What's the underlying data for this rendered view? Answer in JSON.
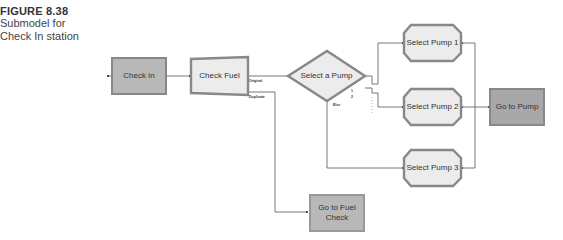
{
  "caption": {
    "figure_number": "FIGURE 8.38",
    "line1": "Submodel for",
    "line2": "Check In station"
  },
  "nodes": {
    "check_in": {
      "label": "Check In",
      "type": "process",
      "color": "#b8b8b8"
    },
    "check_fuel": {
      "label": "Check Fuel",
      "type": "separate",
      "color": "#ececec"
    },
    "select_a_pump": {
      "label": "Select a Pump",
      "type": "decide",
      "color": "#ececec"
    },
    "select_pump_1": {
      "label": "Select Pump 1",
      "type": "seize",
      "color": "#ececec"
    },
    "select_pump_2": {
      "label": "Select Pump 2",
      "type": "seize",
      "color": "#ececec"
    },
    "select_pump_3": {
      "label": "Select Pump 3",
      "type": "seize",
      "color": "#ececec"
    },
    "go_to_pump": {
      "label": "Go to Pump",
      "type": "route",
      "color": "#a8a8a8"
    },
    "go_to_fuel_check": {
      "label": "Go to Fuel Check",
      "line1": "Go to Fuel",
      "line2": "Check",
      "type": "route",
      "color": "#b8b8b8"
    }
  },
  "port_labels": {
    "check_fuel_original": "Original",
    "check_fuel_duplicate": "Duplicate",
    "decide_else": "Else",
    "decide_out_1": "1",
    "decide_out_2": "2"
  }
}
